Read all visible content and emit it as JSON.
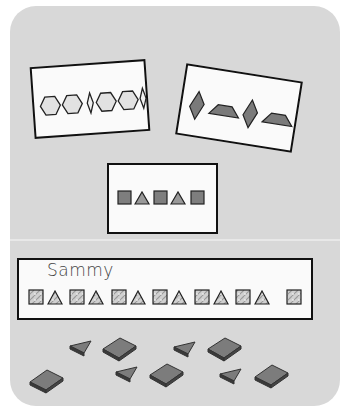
{
  "scene": {
    "description": "Pattern blocks activity board with pattern cards and a student pattern strip",
    "board_color": "#d8d8d8",
    "card_color": "#fafafa",
    "outline_color": "#111111",
    "shape_fill_dark": "#7a7a7a",
    "shape_fill_light": "#dedede"
  },
  "cards": [
    {
      "id": "card-hexagon-rhombus",
      "pattern": [
        "hexagon",
        "hexagon",
        "thin-rhombus",
        "hexagon",
        "hexagon",
        "thin-rhombus"
      ]
    },
    {
      "id": "card-rhombus-trapezoid",
      "pattern": [
        "rhombus",
        "trapezoid",
        "rhombus",
        "trapezoid"
      ]
    },
    {
      "id": "card-square-triangle",
      "pattern": [
        "square",
        "triangle",
        "square",
        "triangle",
        "square"
      ]
    }
  ],
  "student_strip": {
    "name": "Sammy",
    "pattern": [
      "square",
      "triangle",
      "square",
      "triangle",
      "square",
      "triangle",
      "square",
      "triangle",
      "square",
      "triangle",
      "square",
      "triangle",
      "square"
    ]
  },
  "loose_pieces": [
    {
      "shape": "square"
    },
    {
      "shape": "triangle"
    },
    {
      "shape": "square"
    },
    {
      "shape": "triangle"
    },
    {
      "shape": "square"
    },
    {
      "shape": "triangle"
    },
    {
      "shape": "square"
    },
    {
      "shape": "triangle"
    },
    {
      "shape": "square"
    }
  ]
}
